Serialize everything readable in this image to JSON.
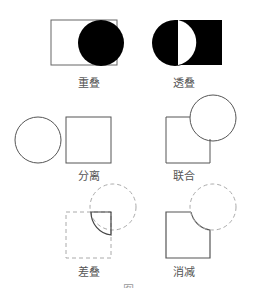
{
  "diagram": {
    "type": "shape-relationship-diagram",
    "panels": [
      {
        "id": "overlap",
        "label": "重叠"
      },
      {
        "id": "transparent-overlap",
        "label": "透叠"
      },
      {
        "id": "separation",
        "label": "分离"
      },
      {
        "id": "union",
        "label": "联合"
      },
      {
        "id": "difference-overlap",
        "label": "差叠"
      },
      {
        "id": "subtraction",
        "label": "消减"
      }
    ],
    "caption": "图"
  },
  "colors": {
    "stroke": "#555555",
    "fill": "#000000",
    "dashed": "#9a9a9a",
    "label": "#555555"
  }
}
